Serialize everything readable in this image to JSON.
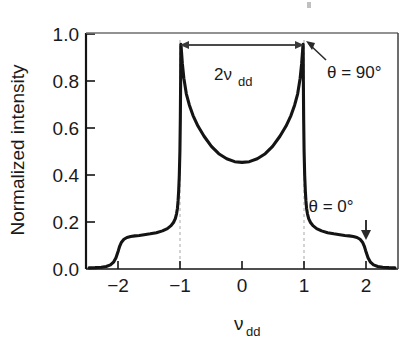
{
  "chart_data": {
    "type": "line",
    "title": "",
    "xlabel": "ν",
    "xlabel_sub": "dd",
    "ylabel": "Normalized intensity",
    "xlim": [
      -2.55,
      2.55
    ],
    "ylim": [
      0.0,
      1.04
    ],
    "xticks": [
      -2,
      -1,
      0,
      1,
      2
    ],
    "xticklabels": [
      "−2",
      "−1",
      "0",
      "1",
      "2"
    ],
    "yticks": [
      0.0,
      0.2,
      0.4,
      0.6,
      0.8,
      1.0
    ],
    "yticklabels": [
      "0.0",
      "0.2",
      "0.4",
      "0.6",
      "0.8",
      "1.0"
    ],
    "grid": false,
    "legend": "none",
    "series": [
      {
        "name": "Pake doublet powder pattern",
        "color": "#141414",
        "x": [
          -2.5,
          -2.4,
          -2.3,
          -2.22,
          -2.15,
          -2.1,
          -2.06,
          -2.02,
          -2.0,
          -1.97,
          -1.93,
          -1.88,
          -1.82,
          -1.75,
          -1.68,
          -1.6,
          -1.5,
          -1.4,
          -1.3,
          -1.22,
          -1.16,
          -1.12,
          -1.09,
          -1.07,
          -1.055,
          -1.045,
          -1.035,
          -1.025,
          -1.015,
          -1.008,
          -1.003,
          -1.0,
          -0.996,
          -0.99,
          -0.975,
          -0.95,
          -0.91,
          -0.86,
          -0.8,
          -0.72,
          -0.62,
          -0.5,
          -0.38,
          -0.25,
          -0.12,
          0.0,
          0.12,
          0.25,
          0.38,
          0.5,
          0.62,
          0.72,
          0.8,
          0.86,
          0.91,
          0.95,
          0.975,
          0.99,
          0.996,
          1.0,
          1.003,
          1.008,
          1.015,
          1.025,
          1.035,
          1.045,
          1.055,
          1.07,
          1.09,
          1.12,
          1.16,
          1.22,
          1.3,
          1.4,
          1.5,
          1.6,
          1.68,
          1.75,
          1.82,
          1.88,
          1.93,
          1.97,
          2.0,
          2.02,
          2.06,
          2.1,
          2.15,
          2.22,
          2.3,
          2.4,
          2.5
        ],
        "y": [
          0.005,
          0.006,
          0.008,
          0.011,
          0.018,
          0.03,
          0.05,
          0.082,
          0.1,
          0.118,
          0.131,
          0.139,
          0.143,
          0.146,
          0.148,
          0.151,
          0.155,
          0.16,
          0.168,
          0.178,
          0.191,
          0.205,
          0.222,
          0.243,
          0.268,
          0.3,
          0.345,
          0.41,
          0.52,
          0.66,
          0.83,
          0.99,
          0.985,
          0.96,
          0.905,
          0.84,
          0.772,
          0.722,
          0.676,
          0.63,
          0.585,
          0.54,
          0.508,
          0.486,
          0.473,
          0.47,
          0.473,
          0.486,
          0.508,
          0.54,
          0.585,
          0.63,
          0.676,
          0.722,
          0.772,
          0.84,
          0.905,
          0.96,
          0.985,
          0.99,
          0.83,
          0.66,
          0.52,
          0.41,
          0.345,
          0.3,
          0.268,
          0.243,
          0.222,
          0.205,
          0.191,
          0.178,
          0.168,
          0.16,
          0.155,
          0.151,
          0.148,
          0.146,
          0.143,
          0.139,
          0.131,
          0.118,
          0.1,
          0.082,
          0.05,
          0.03,
          0.018,
          0.011,
          0.008,
          0.006,
          0.005
        ]
      }
    ],
    "annotations": [
      {
        "id": "span-2nudd",
        "label": "2ν",
        "label_sub": "dd",
        "type": "double-headed-arrow",
        "x_from": -1.0,
        "x_to": 1.0,
        "y": 0.955
      },
      {
        "id": "theta-90",
        "label": "θ = 90°",
        "type": "pointer-arrow",
        "points_to_x": 1.0,
        "points_to_y": 1.0
      },
      {
        "id": "theta-0",
        "label": "θ = 0°",
        "type": "down-arrow",
        "points_to_x": 2.0,
        "points_to_y": 0.14
      }
    ],
    "guide_lines": [
      {
        "id": "guide-minus-one",
        "x": -1.0,
        "style": "dashed",
        "color": "#b9b9b9"
      },
      {
        "id": "guide-plus-one",
        "x": 1.0,
        "style": "dashed",
        "color": "#b9b9b9"
      }
    ]
  }
}
